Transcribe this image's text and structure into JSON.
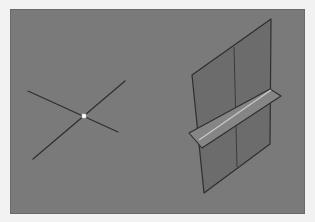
{
  "app": {
    "view": "3D viewport"
  },
  "colors": {
    "frame": "#f2f2f2",
    "viewport_bg": "#7a7a7a",
    "plane_fill": "#6c6c6c",
    "strip_fill": "#858585",
    "strip_highlight": "#c8c8c8",
    "edge": "#2e2e2e",
    "point": "#ffffff"
  },
  "scene": {
    "lines": [
      {
        "name": "line-a",
        "x1": 28,
        "y1": 91,
        "x2": 118,
        "y2": 132
      },
      {
        "name": "line-b",
        "x1": 33,
        "y1": 159,
        "x2": 125,
        "y2": 81
      }
    ],
    "intersection_point": {
      "x": 84,
      "y": 116
    },
    "vertical_plane": {
      "points": "192,75 271,19 270,144 204,193",
      "mid_line": {
        "x1": 234,
        "y1": 47,
        "x2": 237,
        "y2": 167
      }
    },
    "horizontal_strip": {
      "points": "189,133 270,89 281,96 202,148",
      "highlight": {
        "x1": 199,
        "y1": 140,
        "x2": 271,
        "y2": 90
      }
    }
  }
}
